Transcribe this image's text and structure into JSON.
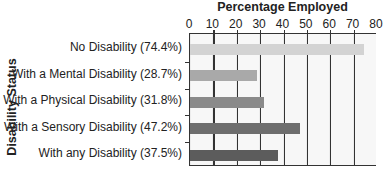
{
  "chart_data": {
    "type": "bar",
    "orientation": "horizontal",
    "title": "Percentage Employed",
    "xlabel": "Percentage Employed",
    "ylabel": "Disability Status",
    "xlim": [
      0,
      80
    ],
    "xticks": [
      "0",
      "10",
      "20",
      "30",
      "40",
      "50",
      "60",
      "70",
      "80"
    ],
    "grid": true,
    "legend": null,
    "categories": [
      "No Disability (74.4%)",
      "With a Mental Disability (28.7%)",
      "With a Physical Disability (31.8%)",
      "With a Sensory Disability (47.2%)",
      "With any Disability (37.5%)"
    ],
    "values": [
      74.4,
      28.7,
      31.8,
      47.2,
      37.5
    ],
    "bar_colors": [
      "#d3d3d3",
      "#a9a9a9",
      "#8a8a8a",
      "#6e6e6e",
      "#5c5c5c"
    ]
  }
}
